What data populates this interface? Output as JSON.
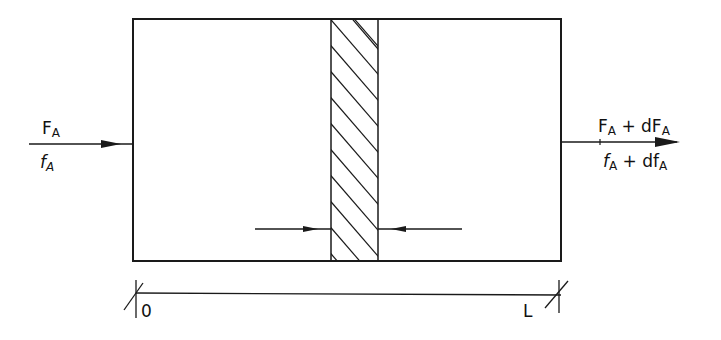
{
  "diagram": {
    "type": "plug-flow reactor differential element",
    "inlet": {
      "top_label": "F",
      "top_sub": "A",
      "bottom_label": "f",
      "bottom_sub": "A"
    },
    "outlet": {
      "top_label": "F",
      "top_sub": "A",
      "top_rest": " + dF",
      "top_sub2": "A",
      "bottom_label": "f",
      "bottom_sub": "A",
      "bottom_rest": " + df",
      "bottom_sub2": "A"
    },
    "axis": {
      "start_label": "0",
      "end_label": "L"
    },
    "colors": {
      "stroke": "#1a1a1a",
      "background": "#ffffff"
    }
  }
}
